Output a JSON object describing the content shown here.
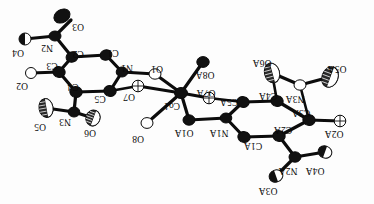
{
  "figure": {
    "kind": "ortep-thermal-ellipsoid-plot",
    "title": "",
    "orientation_note": "all atom labels rendered rotated 180 degrees",
    "background_color": "#fdfdfd",
    "line_color": "#0c0c0c",
    "ellipsoid_fill_dark": "#111111",
    "ellipsoid_fill_light": "#ffffff",
    "central_atom_label": "Co1",
    "atom_labels": [
      "O3",
      "N2",
      "O4",
      "C2",
      "C3",
      "O2",
      "C4",
      "N3",
      "O5",
      "O6",
      "C5",
      "C1",
      "N1",
      "O1",
      "O7",
      "Co1",
      "O8A",
      "O7A",
      "O8",
      "O1A",
      "N1A",
      "C5A",
      "C4A",
      "O6A",
      "O5A",
      "N3A",
      "C3A",
      "O2A",
      "C2A",
      "C1A",
      "N2A",
      "O4A",
      "O3A"
    ],
    "atoms": [
      {
        "id": "O3",
        "label": "O3",
        "x": 71,
        "y": 20,
        "cx": 62,
        "cy": 16,
        "rx": 8.5,
        "ry": 6.5,
        "rot": -30,
        "style": "dark",
        "lx": 78,
        "ly": 26
      },
      {
        "id": "N2",
        "label": "N2",
        "x": 55,
        "y": 36,
        "cx": 55,
        "cy": 36,
        "rx": 6.0,
        "ry": 5.0,
        "rot": 0,
        "style": "dark",
        "lx": 47,
        "ly": 47
      },
      {
        "id": "O4",
        "label": "O4",
        "x": 25,
        "y": 39,
        "cx": 25,
        "cy": 39,
        "rx": 6.0,
        "ry": 6.0,
        "rot": 0,
        "style": "half",
        "lx": 18,
        "ly": 52
      },
      {
        "id": "C2",
        "label": "C2",
        "x": 72,
        "y": 57,
        "cx": 72,
        "cy": 57,
        "rx": 6.0,
        "ry": 5.2,
        "rot": -20,
        "style": "dark",
        "lx": 78,
        "ly": 53
      },
      {
        "id": "C1",
        "label": "C1",
        "x": 106,
        "y": 55,
        "cx": 106,
        "cy": 55,
        "rx": 6.0,
        "ry": 5.2,
        "rot": -20,
        "style": "dark",
        "lx": 113,
        "ly": 52
      },
      {
        "id": "C3",
        "label": "C3",
        "x": 59,
        "y": 72,
        "cx": 59,
        "cy": 72,
        "rx": 6.2,
        "ry": 5.4,
        "rot": 10,
        "style": "dark",
        "lx": 52,
        "ly": 65
      },
      {
        "id": "O2",
        "label": "O2",
        "x": 31,
        "y": 73,
        "cx": 31,
        "cy": 73,
        "rx": 5.5,
        "ry": 5.5,
        "rot": 0,
        "style": "light",
        "lx": 22,
        "ly": 85
      },
      {
        "id": "N1",
        "label": "N1",
        "x": 122,
        "y": 72,
        "cx": 122,
        "cy": 72,
        "rx": 5.8,
        "ry": 5.0,
        "rot": 0,
        "style": "dark",
        "lx": 127,
        "ly": 67
      },
      {
        "id": "C4",
        "label": "C4",
        "x": 76,
        "y": 92,
        "cx": 76,
        "cy": 92,
        "rx": 6.2,
        "ry": 5.4,
        "rot": 10,
        "style": "dark",
        "lx": 73,
        "ly": 86
      },
      {
        "id": "C5",
        "label": "C5",
        "x": 110,
        "y": 91,
        "cx": 110,
        "cy": 91,
        "rx": 6.2,
        "ry": 5.4,
        "rot": 10,
        "style": "dark",
        "lx": 100,
        "ly": 98
      },
      {
        "id": "O1",
        "label": "O1",
        "x": 155,
        "y": 74,
        "cx": 155,
        "cy": 74,
        "rx": 6.0,
        "ry": 5.2,
        "rot": 0,
        "style": "light",
        "lx": 157,
        "ly": 68
      },
      {
        "id": "O7",
        "label": "O7",
        "x": 138,
        "y": 86,
        "cx": 138,
        "cy": 86,
        "rx": 5.8,
        "ry": 5.8,
        "rot": 0,
        "style": "cross",
        "lx": 129,
        "ly": 96
      },
      {
        "id": "N3",
        "label": "N3",
        "x": 74,
        "y": 112,
        "cx": 74,
        "cy": 112,
        "rx": 5.8,
        "ry": 5.0,
        "rot": 0,
        "style": "dark",
        "lx": 65,
        "ly": 121
      },
      {
        "id": "O5",
        "label": "O5",
        "x": 46,
        "y": 108,
        "cx": 46,
        "cy": 108,
        "rx": 7.0,
        "ry": 9.5,
        "rot": -10,
        "style": "hatch",
        "lx": 40,
        "ly": 126
      },
      {
        "id": "O6",
        "label": "O6",
        "x": 93,
        "y": 118,
        "cx": 93,
        "cy": 118,
        "rx": 7.0,
        "ry": 8.0,
        "rot": 20,
        "style": "hatch",
        "lx": 90,
        "ly": 132
      },
      {
        "id": "Co1",
        "label": "Co1",
        "x": 181,
        "y": 93,
        "cx": 181,
        "cy": 93,
        "rx": 6.5,
        "ry": 5.5,
        "rot": 0,
        "style": "dark",
        "lx": 172,
        "ly": 105
      },
      {
        "id": "O8A",
        "label": "O8A",
        "x": 203,
        "y": 62,
        "cx": 203,
        "cy": 62,
        "rx": 6.2,
        "ry": 5.4,
        "rot": 0,
        "style": "dark",
        "lx": 205,
        "ly": 74
      },
      {
        "id": "O7A",
        "label": "O7A",
        "x": 209,
        "y": 98,
        "cx": 209,
        "cy": 98,
        "rx": 5.8,
        "ry": 5.8,
        "rot": 0,
        "style": "cross",
        "lx": 206,
        "ly": 92
      },
      {
        "id": "O8",
        "label": "O8",
        "x": 147,
        "y": 123,
        "cx": 147,
        "cy": 123,
        "rx": 6.0,
        "ry": 5.4,
        "rot": 0,
        "style": "light",
        "lx": 138,
        "ly": 138
      },
      {
        "id": "O1A",
        "label": "O1A",
        "x": 189,
        "y": 120,
        "cx": 189,
        "cy": 120,
        "rx": 6.0,
        "ry": 5.2,
        "rot": 0,
        "style": "dark",
        "lx": 184,
        "ly": 132
      },
      {
        "id": "N1A",
        "label": "N1A",
        "x": 226,
        "y": 118,
        "cx": 226,
        "cy": 118,
        "rx": 5.8,
        "ry": 5.0,
        "rot": 0,
        "style": "dark",
        "lx": 219,
        "ly": 132
      },
      {
        "id": "C5A",
        "label": "C5A",
        "x": 243,
        "y": 102,
        "cx": 243,
        "cy": 102,
        "rx": 6.2,
        "ry": 5.4,
        "rot": 10,
        "style": "dark",
        "lx": 229,
        "ly": 101
      },
      {
        "id": "C1A",
        "label": "C1A",
        "x": 244,
        "y": 137,
        "cx": 244,
        "cy": 137,
        "rx": 6.2,
        "ry": 5.4,
        "rot": 10,
        "style": "dark",
        "lx": 253,
        "ly": 145
      },
      {
        "id": "C4A",
        "label": "C4A",
        "x": 277,
        "y": 101,
        "cx": 277,
        "cy": 101,
        "rx": 6.2,
        "ry": 5.4,
        "rot": 10,
        "style": "dark",
        "lx": 268,
        "ly": 95
      },
      {
        "id": "C2A",
        "label": "C2A",
        "x": 279,
        "y": 136,
        "cx": 279,
        "cy": 136,
        "rx": 6.2,
        "ry": 5.4,
        "rot": 10,
        "style": "dark",
        "lx": 283,
        "ly": 129
      },
      {
        "id": "O6A",
        "label": "O6A",
        "x": 272,
        "y": 73,
        "cx": 272,
        "cy": 73,
        "rx": 7.5,
        "ry": 10.0,
        "rot": -15,
        "style": "hatch",
        "lx": 262,
        "ly": 62
      },
      {
        "id": "N3A",
        "label": "N3A",
        "x": 300,
        "y": 85,
        "cx": 300,
        "cy": 85,
        "rx": 6.0,
        "ry": 5.2,
        "rot": 0,
        "style": "light",
        "lx": 295,
        "ly": 98
      },
      {
        "id": "O5A",
        "label": "O5A",
        "x": 330,
        "y": 77,
        "cx": 330,
        "cy": 77,
        "rx": 8.0,
        "ry": 10.5,
        "rot": 20,
        "style": "hatch",
        "lx": 337,
        "ly": 68
      },
      {
        "id": "C3A",
        "label": "C3A",
        "x": 309,
        "y": 120,
        "cx": 309,
        "cy": 120,
        "rx": 6.2,
        "ry": 5.4,
        "rot": 10,
        "style": "dark",
        "lx": 301,
        "ly": 112
      },
      {
        "id": "O2A",
        "label": "O2A",
        "x": 340,
        "y": 121,
        "cx": 340,
        "cy": 121,
        "rx": 5.8,
        "ry": 5.8,
        "rot": 0,
        "style": "cross",
        "lx": 334,
        "ly": 133
      },
      {
        "id": "N2A",
        "label": "N2A",
        "x": 295,
        "y": 157,
        "cx": 295,
        "cy": 157,
        "rx": 6.0,
        "ry": 5.2,
        "rot": 0,
        "style": "dark",
        "lx": 288,
        "ly": 170
      },
      {
        "id": "O4A",
        "label": "O4A",
        "x": 325,
        "y": 152,
        "cx": 325,
        "cy": 152,
        "rx": 7.0,
        "ry": 6.0,
        "rot": 20,
        "style": "half",
        "lx": 315,
        "ly": 170
      },
      {
        "id": "O3A",
        "label": "O3A",
        "x": 276,
        "y": 176,
        "cx": 276,
        "cy": 176,
        "rx": 7.0,
        "ry": 6.0,
        "rot": -20,
        "style": "half",
        "lx": 268,
        "ly": 190
      }
    ],
    "bonds": [
      {
        "from": "O3",
        "to": "N2",
        "width": "thick"
      },
      {
        "from": "N2",
        "to": "O4",
        "width": "thick"
      },
      {
        "from": "N2",
        "to": "C2",
        "width": "thick"
      },
      {
        "from": "C2",
        "to": "C1",
        "width": "thick"
      },
      {
        "from": "C2",
        "to": "C3",
        "width": "thick"
      },
      {
        "from": "C3",
        "to": "O2",
        "width": "thick"
      },
      {
        "from": "C3",
        "to": "C4",
        "width": "thick"
      },
      {
        "from": "C4",
        "to": "C5",
        "width": "thick"
      },
      {
        "from": "C4",
        "to": "N3",
        "width": "thick"
      },
      {
        "from": "N3",
        "to": "O5",
        "width": "thick"
      },
      {
        "from": "N3",
        "to": "O6",
        "width": "thick"
      },
      {
        "from": "C5",
        "to": "N1",
        "width": "thick"
      },
      {
        "from": "C1",
        "to": "N1",
        "width": "thick"
      },
      {
        "from": "N1",
        "to": "O1",
        "width": "thick"
      },
      {
        "from": "O1",
        "to": "Co1",
        "width": "thick"
      },
      {
        "from": "O7",
        "to": "Co1",
        "width": "thick"
      },
      {
        "from": "O7",
        "to": "C5",
        "width": "med"
      },
      {
        "from": "Co1",
        "to": "O8A",
        "width": "thick"
      },
      {
        "from": "Co1",
        "to": "O7A",
        "width": "thick"
      },
      {
        "from": "Co1",
        "to": "O8",
        "width": "thick"
      },
      {
        "from": "Co1",
        "to": "O1A",
        "width": "thick"
      },
      {
        "from": "O1A",
        "to": "N1A",
        "width": "thick"
      },
      {
        "from": "N1A",
        "to": "C5A",
        "width": "thick"
      },
      {
        "from": "N1A",
        "to": "C1A",
        "width": "thick"
      },
      {
        "from": "C5A",
        "to": "C4A",
        "width": "thick"
      },
      {
        "from": "C1A",
        "to": "C2A",
        "width": "thick"
      },
      {
        "from": "C4A",
        "to": "C3A",
        "width": "thick"
      },
      {
        "from": "C4A",
        "to": "O6A",
        "width": "med"
      },
      {
        "from": "C2A",
        "to": "C3A",
        "width": "thick"
      },
      {
        "from": "C2A",
        "to": "N2A",
        "width": "thick"
      },
      {
        "from": "C3A",
        "to": "O2A",
        "width": "thick"
      },
      {
        "from": "O6A",
        "to": "N3A",
        "width": "thick"
      },
      {
        "from": "N3A",
        "to": "O5A",
        "width": "thick"
      },
      {
        "from": "N3A",
        "to": "C3A",
        "width": "med"
      },
      {
        "from": "N2A",
        "to": "O4A",
        "width": "thick"
      },
      {
        "from": "N2A",
        "to": "O3A",
        "width": "thick"
      },
      {
        "from": "O7A",
        "to": "C5A",
        "width": "med"
      }
    ]
  }
}
